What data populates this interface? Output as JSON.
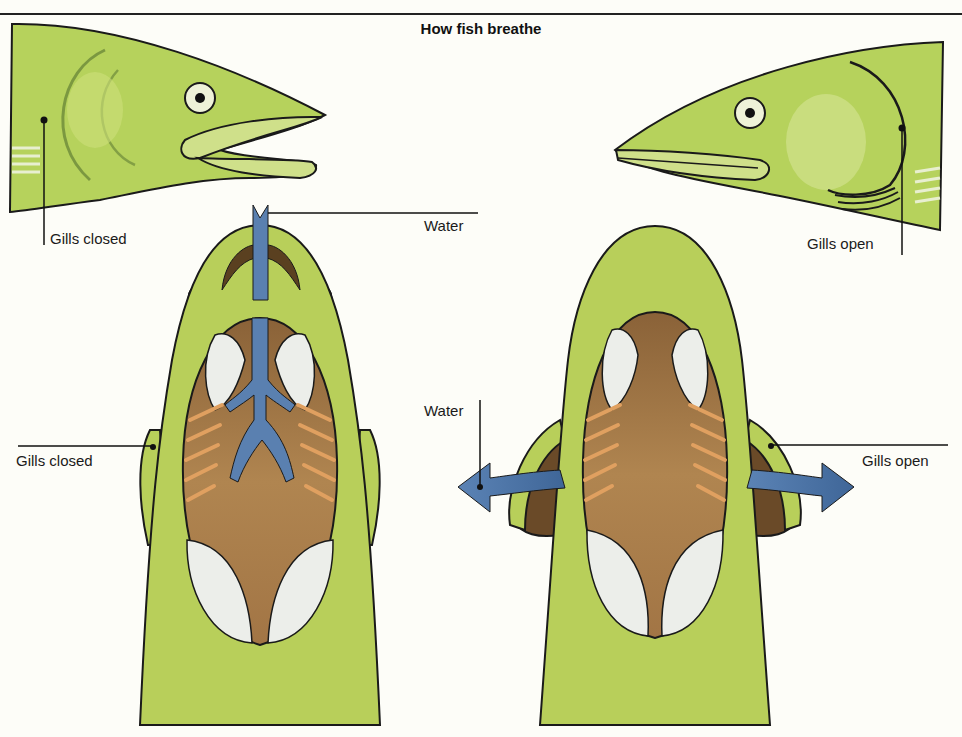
{
  "title": "How fish breathe",
  "colors": {
    "fish_green": "#b8cf5a",
    "head_green": "#b6d25c",
    "mouth_brown": "#a57a48",
    "gill_brown": "#7a5a35",
    "gill_filament": "#e0a060",
    "water_blue": "#5a80b0",
    "white_patch": "#eceeea",
    "outline": "#1a1a1a"
  },
  "left_panel": {
    "state": "mouth open, gills closed",
    "side_view_label": "Gills closed",
    "water_label": "Water",
    "top_view_label": "Gills closed"
  },
  "right_panel": {
    "state": "mouth closed, gills open",
    "side_view_label": "Gills open",
    "water_label": "Water",
    "top_view_label": "Gills open"
  }
}
